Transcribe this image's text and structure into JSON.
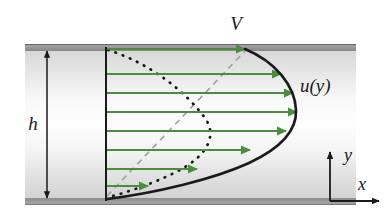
{
  "figure": {
    "type": "technical-diagram",
    "background_color": "#ffffff",
    "channel": {
      "fill_top_color": "#d5d5d5",
      "fill_mid_color": "#fefefe",
      "fill_bottom_color": "#d0d0d0",
      "wall_color": "#8f8f8f",
      "wall_edge_color": "#6e6e6e",
      "left_px": 25,
      "right_px": 356,
      "top_px": 44,
      "bottom_px": 205
    },
    "labels": [
      {
        "name": "velocity-V-label",
        "text": "V",
        "x": 236,
        "y": 30,
        "size": 19
      },
      {
        "name": "channel-height-label",
        "text": "h",
        "x": 33,
        "y": 130,
        "size": 19
      },
      {
        "name": "velocity-profile-label",
        "text": "u(y)",
        "x": 300,
        "y": 92,
        "size": 19
      },
      {
        "name": "axis-y-label",
        "text": "y",
        "x": 352,
        "y": 160,
        "size": 18
      },
      {
        "name": "axis-x-label",
        "text": "x",
        "x": 362,
        "y": 191,
        "size": 18
      }
    ],
    "curves": {
      "velocity_profile_solid": {
        "name": "velocity-profile-curve",
        "style": "solid",
        "color": "#1a1a1a",
        "width": 2.6,
        "description": "Solid black combined Couette-Poiseuille profile: linear near bottom wall, bulging parabolic near top"
      },
      "poiseuille_dotted": {
        "name": "poiseuille-component-curve",
        "style": "dotted",
        "color": "#111111",
        "width": 2.6,
        "description": "Dotted S-shaped pressure-driven component curve"
      },
      "couette_dashed": {
        "name": "couette-component-line",
        "style": "dashed",
        "color": "#9a9a9a",
        "width": 1.6,
        "description": "Dashed gray linear Couette component from bottom-left to top-right"
      },
      "reference_vertical": {
        "name": "reference-vertical-line",
        "style": "solid",
        "color": "#1a1a1a",
        "width": 2.0,
        "x_px": 106
      }
    },
    "velocity_arrows": {
      "name": "velocity-vector-arrows",
      "color": "#4c8c3f",
      "width": 2.0,
      "origin_x_px": 106,
      "vectors": [
        {
          "y_px": 74,
          "tip_x_px": 281
        },
        {
          "y_px": 93,
          "tip_x_px": 293
        },
        {
          "y_px": 112,
          "tip_x_px": 297
        },
        {
          "y_px": 131,
          "tip_x_px": 286
        },
        {
          "y_px": 150,
          "tip_x_px": 250
        },
        {
          "y_px": 169,
          "tip_x_px": 197
        },
        {
          "y_px": 186,
          "tip_x_px": 148
        }
      ],
      "top_wall_vector": {
        "name": "wall-velocity-arrow",
        "y_px": 49,
        "start_x_px": 106,
        "tip_x_px": 245
      }
    },
    "dimension_arrow": {
      "name": "channel-height-dimension-arrow",
      "color": "#1a1a1a",
      "x_px": 47,
      "top_px": 50,
      "bottom_px": 199,
      "double_headed": true
    },
    "axes": {
      "name": "coordinate-axes",
      "color": "#1a1a1a",
      "origin_x_px": 330,
      "origin_y_px": 201,
      "y_axis_top_px": 152,
      "x_axis_right_px": 379
    }
  }
}
